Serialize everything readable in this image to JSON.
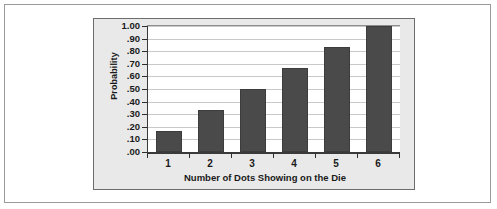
{
  "chart_data": {
    "type": "bar",
    "title": "",
    "subtitle": "",
    "xlabel": "Number of Dots Showing on the Die",
    "ylabel": "Probability",
    "categories": [
      "1",
      "2",
      "3",
      "4",
      "5",
      "6"
    ],
    "values": [
      0.167,
      0.333,
      0.5,
      0.667,
      0.833,
      1.0
    ],
    "series": [
      {
        "name": "Cumulative probability",
        "values": [
          0.167,
          0.333,
          0.5,
          0.667,
          0.833,
          1.0
        ]
      }
    ],
    "ylim": [
      0.0,
      1.0
    ],
    "ytick_values": [
      1.0,
      0.9,
      0.8,
      0.7,
      0.6,
      0.5,
      0.4,
      0.3,
      0.2,
      0.1,
      0.0
    ],
    "ytick_labels": [
      "1.00",
      ".90",
      ".80",
      ".70",
      ".60",
      ".50",
      ".40",
      ".30",
      ".20",
      ".10",
      ".00"
    ],
    "xtick_labels": [
      "1",
      "2",
      "3",
      "4",
      "5",
      "6"
    ],
    "grid": true,
    "grid_axis": "y",
    "legend": false,
    "legend_position": "none",
    "annotations": [],
    "colors": {
      "bar_fill": "#4a4a4a",
      "bar_border": "#3c3c3c",
      "gridline": "#c9c9c9",
      "axis_line": "#3a3a3a",
      "plot_background": "#ffffff",
      "panel_background": "#e9e9e9",
      "panel_border": "#6d6d6d",
      "page_background": "#ffffff",
      "page_border": "#9a9a9a",
      "text": "#1a1a1a"
    }
  }
}
